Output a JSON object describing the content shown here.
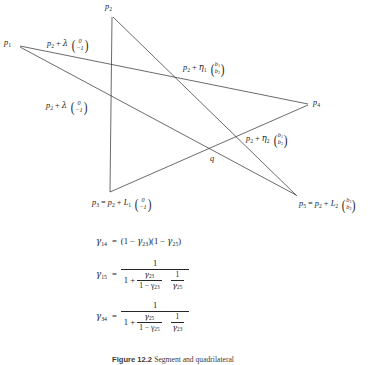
{
  "figure": {
    "type": "geometric-diagram",
    "points": [
      {
        "id": "p2",
        "label": "p",
        "sub": "2",
        "x": 112,
        "y": 17,
        "label_text": "p2"
      },
      {
        "id": "p1",
        "label": "p",
        "sub": "1",
        "x": 18,
        "y": 44,
        "label_text": "p1"
      },
      {
        "id": "p4",
        "label": "p",
        "sub": "4",
        "x": 310,
        "y": 104,
        "label_text": "p4"
      },
      {
        "id": "q",
        "label": "q",
        "sub": "",
        "x": 211,
        "y": 158,
        "label_text": "q"
      },
      {
        "id": "p3",
        "label": "p",
        "sub": "3",
        "x": 110,
        "y": 192,
        "label_text": "p3"
      },
      {
        "id": "p5",
        "label": "p",
        "sub": "5",
        "x": 298,
        "y": 197,
        "label_text": "p5"
      }
    ],
    "edges": [
      {
        "from": "p2",
        "to": "p3"
      },
      {
        "from": "p2",
        "to": "p5"
      },
      {
        "from": "p1",
        "to": "p4"
      },
      {
        "from": "p1",
        "to": "p5"
      },
      {
        "from": "p3",
        "to": "p4"
      }
    ],
    "labels": {
      "p1": "p",
      "p1_sub": "1",
      "p2": "p",
      "p2_sub": "2",
      "p4": "p",
      "p4_sub": "4",
      "q": "q",
      "lambda_upper": "p2 + λ (0 / −1)",
      "lambda_lower": "p2 + λ (0 / −1)",
      "eta1": "p2 + η1 (b1 / b2)",
      "eta2": "p2 + η2 (b1 / b2)",
      "p3_full": "p3 = p2 + L1 (0 / −1)",
      "p5_full": "p5 = p2 + L2 (b1 / b2)",
      "vec_zero": "0",
      "vec_minus_one": "−1",
      "vec_b1": "b",
      "vec_b1_sub": "1",
      "vec_b2": "b",
      "vec_b2_sub": "2",
      "p_sym": "p",
      "plus": "+",
      "equals": "=",
      "lambda_sym": "λ",
      "eta_sym": "η",
      "L_sym": "L",
      "sub_1": "1",
      "sub_2": "2",
      "sub_3": "3",
      "sub_5": "5"
    }
  },
  "equations": {
    "gamma": "γ",
    "equals": "=",
    "one": "1",
    "plus": "+",
    "eq1": {
      "lhs_sym": "γ",
      "lhs_sub": "14",
      "rhs_text": "(1 − γ23)(1 − γ25)",
      "open": "(",
      "close": ")",
      "one_minus": "1 −",
      "g23_sub": "23",
      "g25_sub": "25"
    },
    "eq2": {
      "lhs_sym": "γ",
      "lhs_sub": "15",
      "num": "1",
      "den_one_plus": "1 +",
      "inner_num_sub": "23",
      "inner_den_text": "1 − γ",
      "inner_den_sub": "23",
      "tail_num": "1",
      "tail_den_sub": "25"
    },
    "eq3": {
      "lhs_sym": "γ",
      "lhs_sub": "34",
      "num": "1",
      "den_one_plus": "1 +",
      "inner_num_sub": "25",
      "inner_den_text": "1 − γ",
      "inner_den_sub": "25",
      "tail_num": "1",
      "tail_den_sub": "23"
    }
  },
  "caption": {
    "prefix": "Figure 12.2",
    "rest": "Segment and quadrilateral"
  },
  "colors": {
    "stroke": "#2b2b2b",
    "text": "#1a1a1a",
    "background": "#ffffff"
  }
}
